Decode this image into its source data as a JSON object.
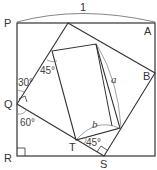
{
  "diagram": {
    "dimension_label": "1",
    "points": {
      "P": "P",
      "A": "A",
      "B": "B",
      "Q": "Q",
      "R": "R",
      "S": "S",
      "T": "T"
    },
    "angles": {
      "at_Q_upper": "30°",
      "at_Q_lower": "60°",
      "inner_top_left": "45°",
      "at_T": "45°"
    },
    "lengths": {
      "a": "a",
      "b": "b"
    },
    "colors": {
      "stroke": "#333333",
      "thin": "#777777"
    }
  }
}
